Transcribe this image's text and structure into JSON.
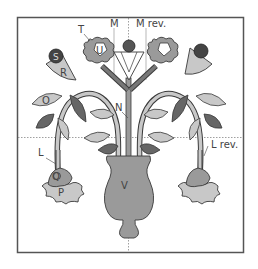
{
  "diagram": {
    "labels": {
      "T": "T",
      "U": "U",
      "M": "M",
      "M_rev": "M rev.",
      "S": "S",
      "R": "R",
      "O": "O",
      "N": "N",
      "L": "L",
      "L_rev": "L rev.",
      "Q": "Q",
      "P": "P",
      "V": "V"
    },
    "colors": {
      "frame": "#555555",
      "dark": "#666666",
      "medium": "#9a9a9a",
      "light": "#c8c8c8",
      "outline": "#3a3a3a",
      "guide": "#777777"
    }
  }
}
